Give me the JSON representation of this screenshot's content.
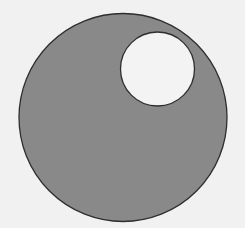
{
  "diagram": {
    "background_color": "#f1f1f1",
    "outer_circle": {
      "cx": 123,
      "cy": 117.5,
      "r": 104,
      "fill": "#898989",
      "stroke": "#2e2e2e"
    },
    "inner_circle": {
      "cx": 157.5,
      "cy": 69,
      "r": 37,
      "fill": "#f3f3f3",
      "stroke": "#2e2e2e"
    }
  }
}
